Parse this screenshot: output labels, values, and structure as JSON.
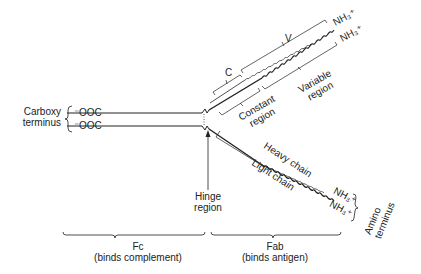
{
  "diagram": {
    "title_topic": "Antibody (IgG) structure",
    "left": {
      "label_line1": "Carboxy",
      "label_line2": "terminus",
      "term_top": "⁻OOC",
      "term_bottom": "⁻OOC"
    },
    "upper_arm": {
      "c_label": "C",
      "v_label": "V",
      "nh3_top": "NH₃⁺",
      "nh3_bottom": "NH₃⁺",
      "constant_label_1": "Constant",
      "constant_label_2": "region",
      "variable_label_1": "Variable",
      "variable_label_2": "region"
    },
    "lower_arm": {
      "heavy_chain": "Heavy chain",
      "light_chain": "Light chain",
      "nh3_top": "NH₃⁺",
      "nh3_bottom": "NH₃⁺",
      "amino_1": "Amino",
      "amino_2": "terminus"
    },
    "hinge": {
      "line1": "Hinge",
      "line2": "region"
    },
    "bottom": {
      "fc_label": "Fc",
      "fc_desc": "(binds complement)",
      "fab_label": "Fab",
      "fab_desc": "(binds antigen)"
    },
    "colors": {
      "line": "#222222",
      "background": "#ffffff"
    }
  }
}
